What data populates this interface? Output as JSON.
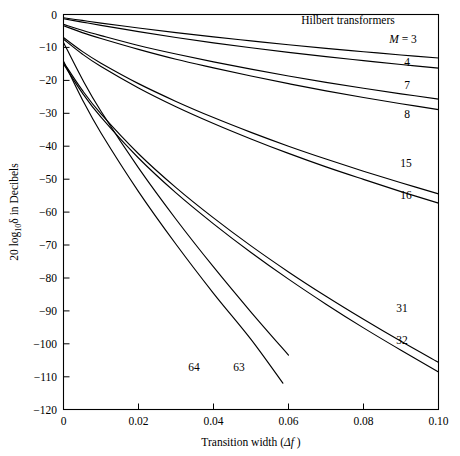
{
  "figure": {
    "heading": "Hilbert transformers",
    "background_color": "#ffffff",
    "line_color": "#000000"
  },
  "axes": {
    "x_title_prefix": "Transition width (",
    "x_title_delta": "Δf",
    "x_title_suffix": " )",
    "y_title_prefix": "20 log",
    "y_title_sub": "10",
    "y_title_delta": "δ",
    "y_title_suffix": " in Decibels",
    "x_ticks": [
      "0",
      "0.02",
      "0.04",
      "0.06",
      "0.08",
      "0.10"
    ],
    "y_ticks": [
      "0",
      "−10",
      "−20",
      "−30",
      "−40",
      "−50",
      "−60",
      "−70",
      "−80",
      "−90",
      "−100",
      "−110",
      "−120"
    ]
  },
  "curve_labels": {
    "m_equals": "M = 3",
    "l4": "4",
    "l7": "7",
    "l8": "8",
    "l15": "15",
    "l16": "16",
    "l31": "31",
    "l32": "32",
    "l63": "63",
    "l64": "64"
  },
  "chart_data": {
    "type": "line",
    "title": "Hilbert transformers",
    "xlabel": "Transition width (Δf )",
    "ylabel": "20 log10 δ in Decibels",
    "xlim": [
      0.0,
      0.1
    ],
    "ylim": [
      -120,
      0
    ],
    "xticks": [
      0.0,
      0.02,
      0.04,
      0.06,
      0.08,
      0.1
    ],
    "yticks": [
      0,
      -10,
      -20,
      -30,
      -40,
      -50,
      -60,
      -70,
      -80,
      -90,
      -100,
      -110,
      -120
    ],
    "grid": false,
    "legend": "inline curve labels at right",
    "series": [
      {
        "name": "M = 3",
        "label": "M = 3",
        "x": [
          0.0,
          0.005,
          0.01,
          0.02,
          0.03,
          0.04,
          0.05,
          0.06,
          0.07,
          0.08,
          0.09,
          0.1
        ],
        "y": [
          -1.0,
          -1.8,
          -2.6,
          -4.1,
          -5.5,
          -6.8,
          -8.0,
          -9.2,
          -10.3,
          -11.3,
          -12.3,
          -13.2
        ]
      },
      {
        "name": "M = 4",
        "label": "4",
        "x": [
          0.0,
          0.005,
          0.01,
          0.02,
          0.03,
          0.04,
          0.05,
          0.06,
          0.07,
          0.08,
          0.09,
          0.1
        ],
        "y": [
          -1.3,
          -2.3,
          -3.3,
          -5.2,
          -7.0,
          -8.6,
          -10.1,
          -11.5,
          -12.8,
          -14.0,
          -15.2,
          -16.3
        ]
      },
      {
        "name": "M = 7",
        "label": "7",
        "x": [
          0.0,
          0.005,
          0.01,
          0.02,
          0.03,
          0.04,
          0.05,
          0.06,
          0.07,
          0.08,
          0.09,
          0.1
        ],
        "y": [
          -3.0,
          -4.8,
          -6.4,
          -9.4,
          -12.0,
          -14.4,
          -16.6,
          -18.7,
          -20.6,
          -22.4,
          -24.1,
          -25.7
        ]
      },
      {
        "name": "M = 8",
        "label": "8",
        "x": [
          0.0,
          0.005,
          0.01,
          0.02,
          0.03,
          0.04,
          0.05,
          0.06,
          0.07,
          0.08,
          0.09,
          0.1
        ],
        "y": [
          -3.4,
          -5.5,
          -7.3,
          -10.6,
          -13.6,
          -16.2,
          -18.7,
          -21.0,
          -23.2,
          -25.2,
          -27.1,
          -28.9
        ]
      },
      {
        "name": "M = 15",
        "label": "15",
        "x": [
          0.0,
          0.005,
          0.01,
          0.02,
          0.03,
          0.04,
          0.05,
          0.06,
          0.07,
          0.08,
          0.09,
          0.1
        ],
        "y": [
          -7.0,
          -11.2,
          -14.8,
          -21.0,
          -26.4,
          -31.3,
          -35.8,
          -40.0,
          -43.9,
          -47.6,
          -51.1,
          -54.5
        ]
      },
      {
        "name": "M = 16",
        "label": "16",
        "x": [
          0.0,
          0.005,
          0.01,
          0.02,
          0.03,
          0.04,
          0.05,
          0.06,
          0.07,
          0.08,
          0.09,
          0.1
        ],
        "y": [
          -7.5,
          -12.0,
          -15.8,
          -22.3,
          -28.0,
          -33.1,
          -37.8,
          -42.2,
          -46.3,
          -50.1,
          -53.8,
          -57.3
        ]
      },
      {
        "name": "M = 31",
        "label": "31",
        "x": [
          0.0,
          0.005,
          0.01,
          0.02,
          0.03,
          0.04,
          0.05,
          0.06,
          0.07,
          0.08,
          0.09,
          0.1
        ],
        "y": [
          -14.5,
          -23.0,
          -30.2,
          -42.3,
          -52.6,
          -61.8,
          -70.3,
          -78.2,
          -85.6,
          -92.6,
          -99.3,
          -105.7
        ]
      },
      {
        "name": "M = 32",
        "label": "32",
        "x": [
          0.0,
          0.005,
          0.01,
          0.02,
          0.03,
          0.04,
          0.05,
          0.06,
          0.07,
          0.08,
          0.09,
          0.1
        ],
        "y": [
          -15.0,
          -23.8,
          -31.2,
          -43.6,
          -54.2,
          -63.6,
          -72.3,
          -80.4,
          -88.0,
          -95.2,
          -102.0,
          -108.6
        ]
      },
      {
        "name": "M = 63",
        "label": "63",
        "x": [
          0.0,
          0.005,
          0.01,
          0.02,
          0.03,
          0.04,
          0.05,
          0.06
        ],
        "y": [
          -8.5,
          -19.6,
          -29.4,
          -46.6,
          -62.2,
          -76.7,
          -90.4,
          -103.5
        ]
      },
      {
        "name": "M = 64",
        "label": "64",
        "x": [
          0.0,
          0.005,
          0.01,
          0.02,
          0.03,
          0.04,
          0.05,
          0.0585
        ],
        "y": [
          -14.2,
          -25.8,
          -36.0,
          -53.8,
          -69.8,
          -84.7,
          -98.7,
          -112.0
        ]
      }
    ]
  }
}
